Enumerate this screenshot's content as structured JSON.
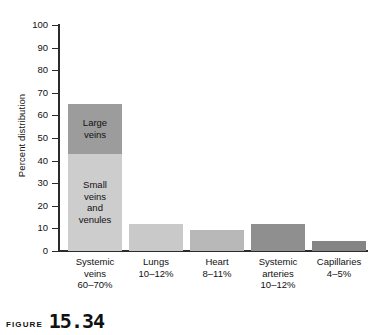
{
  "chart_data": {
    "type": "bar",
    "title": "",
    "xlabel": "",
    "ylabel": "Percent distribution",
    "ylim": [
      0,
      100
    ],
    "ytick_labels": [
      "100",
      "90",
      "80",
      "70",
      "60",
      "50",
      "40",
      "30",
      "20",
      "10",
      "0"
    ],
    "yticks": [
      100,
      90,
      80,
      70,
      60,
      50,
      40,
      30,
      20,
      10,
      0
    ],
    "grid": false,
    "legend": "none",
    "stacked_first_bar": true,
    "categories": [
      "Systemic veins",
      "Lungs",
      "Heart",
      "Systemic arteries",
      "Capillaries"
    ],
    "category_ranges": [
      "60–70%",
      "10–12%",
      "8–11%",
      "10–12%",
      "4–5%"
    ],
    "values": [
      65,
      12,
      9.5,
      12,
      4.5
    ],
    "bars": [
      {
        "category": "Systemic veins",
        "range_label": "60–70%",
        "total": 65,
        "segments": [
          {
            "label": "Large\nveins",
            "from": 43,
            "to": 65,
            "value": 22,
            "color": "#9c9c9c"
          },
          {
            "label": "Small\nveins\nand\nvenules",
            "from": 0,
            "to": 43,
            "value": 43,
            "color": "#cdcdcd"
          }
        ]
      },
      {
        "category": "Lungs",
        "range_label": "10–12%",
        "total": 12,
        "segments": [
          {
            "label": "",
            "from": 0,
            "to": 12,
            "value": 12,
            "color": "#c9c9c9"
          }
        ]
      },
      {
        "category": "Heart",
        "range_label": "8–11%",
        "total": 9.5,
        "segments": [
          {
            "label": "",
            "from": 0,
            "to": 9.5,
            "value": 9.5,
            "color": "#b8b8b8"
          }
        ]
      },
      {
        "category": "Systemic arteries",
        "range_label": "10–12%",
        "total": 12,
        "segments": [
          {
            "label": "",
            "from": 0,
            "to": 12,
            "value": 12,
            "color": "#8f8f8f"
          }
        ]
      },
      {
        "category": "Capillaries",
        "range_label": "4–5%",
        "total": 4.5,
        "segments": [
          {
            "label": "",
            "from": 0,
            "to": 4.5,
            "value": 4.5,
            "color": "#858585"
          }
        ]
      }
    ],
    "category_label_lines": [
      "Systemic\nveins\n60–70%",
      "Lungs\n10–12%",
      "Heart\n8–11%",
      "Systemic\narteries\n10–12%",
      "Capillaries\n4–5%"
    ],
    "axis_color": "#2b2b2b"
  },
  "caption": {
    "word": "Figure",
    "number": "15.34"
  }
}
